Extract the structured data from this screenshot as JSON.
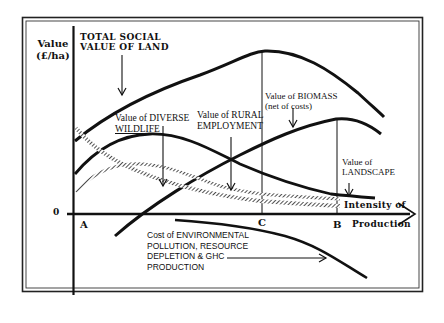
{
  "diagram": {
    "y_axis_label_line1": "Value",
    "y_axis_label_line2": "(£/ha)",
    "zero_label": "0",
    "x_axis_label_line1": "Intensity of",
    "x_axis_label_line2": "Production",
    "points": {
      "A": "A",
      "B": "B",
      "C": "C"
    },
    "curves": {
      "total_social_value": {
        "label_line1": "TOTAL SOCIAL",
        "label_line2": "VALUE OF LAND"
      },
      "biomass": {
        "label_line1": "Value of BIOMASS",
        "label_line2": "(net of costs)"
      },
      "diverse_wildlife": {
        "label_line1": "Value of DIVERSE",
        "label_line2": "WILDLIFE"
      },
      "rural_employment": {
        "label_line1": "Value of RURAL",
        "label_line2": "EMPLOYMENT"
      },
      "landscape": {
        "label_line1": "Value of",
        "label_line2": "LANDSCAPE"
      },
      "environmental_cost": {
        "label_line1": "Cost of ENVIRONMENTAL",
        "label_line2": "POLLUTION, RESOURCE",
        "label_line3": "DEPLETION & GHC",
        "label_line4": "PRODUCTION"
      }
    },
    "colors": {
      "ink": "#111111",
      "background": "#ffffff"
    }
  }
}
